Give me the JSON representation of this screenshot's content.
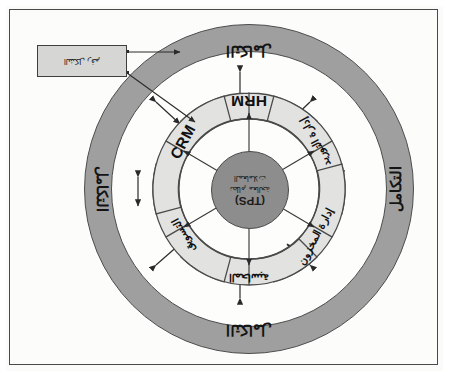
{
  "figure": {
    "title_latin": "(TPS)",
    "orientation_note": "scan rotated 180 degrees",
    "colors": {
      "ring_fill": "#9f9f9f",
      "petal_fill": "#e2e2e0",
      "center_fill": "#8d8d8d",
      "callout_fill": "#d6d6d4",
      "stroke": "#4a4a4a",
      "page": "#fcfcfb"
    }
  },
  "outer_ring": {
    "labels": {
      "top": "التكامل",
      "bottom": "التكامل",
      "left": "التكامل",
      "right": "التكامل"
    }
  },
  "center": {
    "code": "(TPS)",
    "line1": "نظام معالجة",
    "line2": "المعاملات"
  },
  "petals": [
    {
      "id": "hrm",
      "label": "HRM",
      "script": "latin",
      "position": "top"
    },
    {
      "id": "ur",
      "label": "إدارة التوريد",
      "script": "arabic",
      "position": "upper-right"
    },
    {
      "id": "lr",
      "label": "إدارة المخزون",
      "script": "arabic",
      "position": "lower-right"
    },
    {
      "id": "bot",
      "label": "المحاسبة",
      "script": "arabic",
      "position": "bottom"
    },
    {
      "id": "ll",
      "label": "التسويق",
      "script": "arabic",
      "position": "lower-left"
    },
    {
      "id": "crm",
      "label": "CRM",
      "script": "latin",
      "position": "upper-left"
    }
  ],
  "callout": {
    "text": "الشكل رقم"
  }
}
